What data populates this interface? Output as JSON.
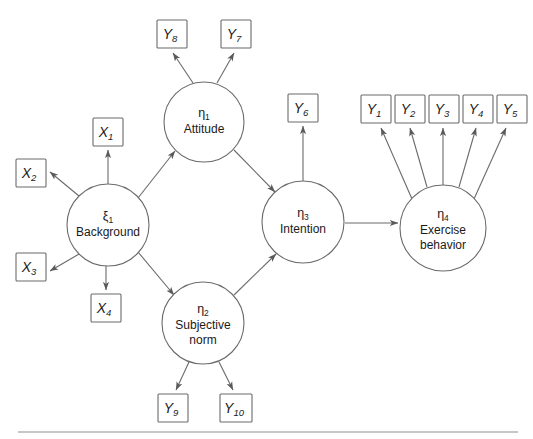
{
  "diagram": {
    "type": "path-diagram",
    "background_color": "#ffffff",
    "line_color": "#6b6b6b",
    "text_color": "#1a1a1a",
    "footer_rule_color": "#8f8f8f"
  },
  "latent_variables": [
    {
      "id": "xi1",
      "symbol": "ξ",
      "subscript": "1",
      "name": "Background",
      "name_line2": "",
      "cx": 108,
      "cy": 225,
      "r": 41
    },
    {
      "id": "eta1",
      "symbol": "η",
      "subscript": "1",
      "name": "Attitude",
      "name_line2": "",
      "cx": 204,
      "cy": 122,
      "r": 40
    },
    {
      "id": "eta2",
      "symbol": "η",
      "subscript": "2",
      "name": "Subjective",
      "name_line2": "norm",
      "cx": 203,
      "cy": 323,
      "r": 41
    },
    {
      "id": "eta3",
      "symbol": "η",
      "subscript": "3",
      "name": "Intention",
      "name_line2": "",
      "cx": 303,
      "cy": 222,
      "r": 41
    },
    {
      "id": "eta4",
      "symbol": "η",
      "subscript": "4",
      "name": "Exercise",
      "name_line2": "behavior",
      "cx": 443,
      "cy": 228,
      "r": 43
    }
  ],
  "observed_variables": [
    {
      "id": "X1",
      "symbol": "X",
      "subscript": "1",
      "x": 93,
      "y": 118,
      "w": 30,
      "h": 28
    },
    {
      "id": "X2",
      "symbol": "X",
      "subscript": "2",
      "x": 16,
      "y": 159,
      "w": 30,
      "h": 28
    },
    {
      "id": "X3",
      "symbol": "X",
      "subscript": "3",
      "x": 16,
      "y": 253,
      "w": 30,
      "h": 28
    },
    {
      "id": "X4",
      "symbol": "X",
      "subscript": "4",
      "x": 91,
      "y": 294,
      "w": 30,
      "h": 28
    },
    {
      "id": "Y8",
      "symbol": "Y",
      "subscript": "8",
      "x": 157,
      "y": 20,
      "w": 30,
      "h": 28
    },
    {
      "id": "Y7",
      "symbol": "Y",
      "subscript": "7",
      "x": 221,
      "y": 20,
      "w": 30,
      "h": 28
    },
    {
      "id": "Y6",
      "symbol": "Y",
      "subscript": "6",
      "x": 288,
      "y": 94,
      "w": 30,
      "h": 28
    },
    {
      "id": "Y1",
      "symbol": "Y",
      "subscript": "1",
      "x": 361,
      "y": 95,
      "w": 30,
      "h": 28
    },
    {
      "id": "Y2",
      "symbol": "Y",
      "subscript": "2",
      "x": 395,
      "y": 95,
      "w": 30,
      "h": 28
    },
    {
      "id": "Y3",
      "symbol": "Y",
      "subscript": "3",
      "x": 429,
      "y": 95,
      "w": 30,
      "h": 28
    },
    {
      "id": "Y4",
      "symbol": "Y",
      "subscript": "4",
      "x": 463,
      "y": 95,
      "w": 30,
      "h": 28
    },
    {
      "id": "Y5",
      "symbol": "Y",
      "subscript": "5",
      "x": 497,
      "y": 95,
      "w": 30,
      "h": 28
    },
    {
      "id": "Y9",
      "symbol": "Y",
      "subscript": "9",
      "x": 158,
      "y": 394,
      "w": 30,
      "h": 28
    },
    {
      "id": "Y10",
      "symbol": "Y",
      "subscript": "10",
      "x": 220,
      "y": 394,
      "w": 32,
      "h": 28
    }
  ],
  "paths": [
    {
      "from": "xi1",
      "to": "X1",
      "kind": "measurement"
    },
    {
      "from": "xi1",
      "to": "X2",
      "kind": "measurement"
    },
    {
      "from": "xi1",
      "to": "X3",
      "kind": "measurement"
    },
    {
      "from": "xi1",
      "to": "X4",
      "kind": "measurement"
    },
    {
      "from": "xi1",
      "to": "eta1",
      "kind": "structural"
    },
    {
      "from": "xi1",
      "to": "eta2",
      "kind": "structural"
    },
    {
      "from": "eta1",
      "to": "Y8",
      "kind": "measurement"
    },
    {
      "from": "eta1",
      "to": "Y7",
      "kind": "measurement"
    },
    {
      "from": "eta1",
      "to": "eta3",
      "kind": "structural"
    },
    {
      "from": "eta2",
      "to": "Y9",
      "kind": "measurement"
    },
    {
      "from": "eta2",
      "to": "Y10",
      "kind": "measurement"
    },
    {
      "from": "eta2",
      "to": "eta3",
      "kind": "structural"
    },
    {
      "from": "eta3",
      "to": "Y6",
      "kind": "measurement"
    },
    {
      "from": "eta3",
      "to": "eta4",
      "kind": "structural"
    },
    {
      "from": "eta4",
      "to": "Y1",
      "kind": "measurement"
    },
    {
      "from": "eta4",
      "to": "Y2",
      "kind": "measurement"
    },
    {
      "from": "eta4",
      "to": "Y3",
      "kind": "measurement"
    },
    {
      "from": "eta4",
      "to": "Y4",
      "kind": "measurement"
    },
    {
      "from": "eta4",
      "to": "Y5",
      "kind": "measurement"
    }
  ],
  "footer": {
    "rule_x1": 18,
    "rule_x2": 518,
    "rule_y": 432
  }
}
